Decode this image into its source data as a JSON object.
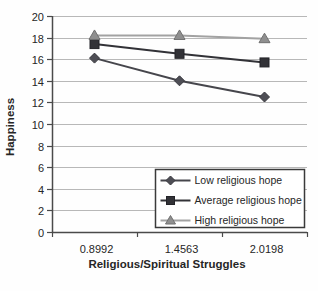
{
  "chart_data": {
    "type": "line",
    "title": "",
    "xlabel": "Religious/Spiritual Struggles",
    "ylabel": "Happiness",
    "categories": [
      "0.8992",
      "1.4563",
      "2.0198"
    ],
    "series": [
      {
        "name": "Low religious hope",
        "marker": "diamond",
        "values": [
          16.1,
          14.0,
          12.5
        ],
        "line_color": "#46464c",
        "marker_color": "#4e4e55",
        "marker_edge": "#38383e"
      },
      {
        "name": "Average religious hope",
        "marker": "square",
        "values": [
          17.4,
          16.5,
          15.7
        ],
        "line_color": "#323237",
        "marker_color": "#323237",
        "marker_edge": "#232328"
      },
      {
        "name": "High religious hope",
        "marker": "triangle",
        "values": [
          18.2,
          18.2,
          17.9
        ],
        "line_color": "#a2a2a2",
        "marker_color": "#8f8f8f",
        "marker_edge": "#707070"
      }
    ],
    "ylim": [
      0,
      20
    ],
    "ytick_step": 2,
    "ytick_labels": [
      "0",
      "2",
      "4",
      "6",
      "8",
      "10",
      "12",
      "14",
      "16",
      "18",
      "20"
    ],
    "grid": true,
    "legend_position": "inside-bottom-right",
    "styles": {
      "grid_color": "#b8b8b8",
      "axis_color": "#4a4a4a",
      "text_color": "#262626",
      "legend_border": "#3a3a3a",
      "legend_bg": "#ffffff",
      "background": "#fefefe"
    }
  }
}
